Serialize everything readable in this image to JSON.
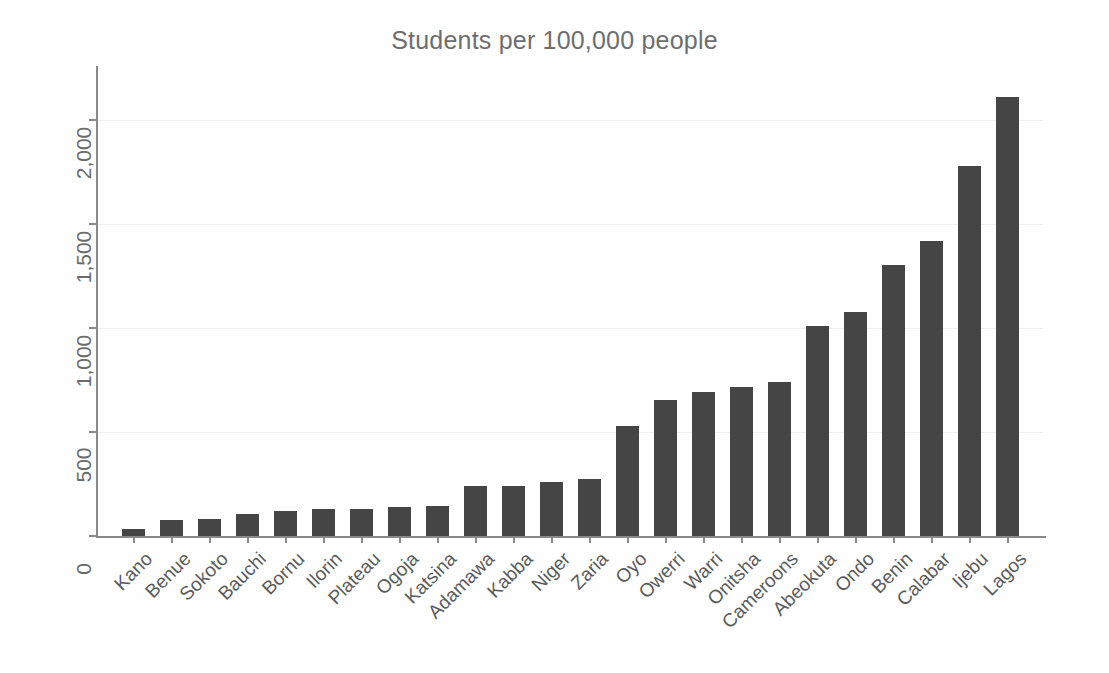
{
  "chart_data": {
    "type": "bar",
    "title": "Students per 100,000 people",
    "xlabel": "",
    "ylabel": "",
    "ylim": [
      0,
      2200
    ],
    "yticks": [
      0,
      500,
      1000,
      1500,
      2000
    ],
    "ytick_labels": [
      "0",
      "500",
      "1,000",
      "1,500",
      "2,000"
    ],
    "grid": true,
    "legend": null,
    "bar_color": "#454545",
    "categories": [
      "Kano",
      "Benue",
      "Sokoto",
      "Bauchi",
      "Bornu",
      "Ilorin",
      "Plateau",
      "Ogoja",
      "Katsina",
      "Adamawa",
      "Kabba",
      "Niger",
      "Zaria",
      "Oyo",
      "Owerri",
      "Warri",
      "Onitsha",
      "Cameroons",
      "Abeokuta",
      "Ondo",
      "Benin",
      "Calabar",
      "Ijebu",
      "Lagos"
    ],
    "values": [
      35,
      75,
      80,
      105,
      120,
      130,
      130,
      140,
      145,
      240,
      240,
      260,
      275,
      530,
      655,
      690,
      715,
      740,
      1010,
      1075,
      1300,
      1415,
      1775,
      2110
    ]
  },
  "figure": {
    "background": "#fefefe",
    "axis_color": "#8a8a8a",
    "title_color": "#6e6e6e",
    "tick_label_color": "#5b5b5b"
  }
}
